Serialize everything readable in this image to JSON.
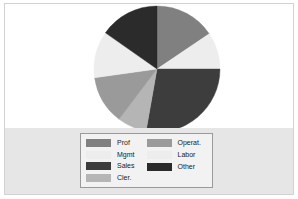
{
  "figure": {
    "background_color": "#ffffff",
    "band_color": "#e6e6e6",
    "frame_color": "#d2d2d2"
  },
  "chart_data": {
    "type": "pie",
    "title": "",
    "subtitle": "",
    "xlabel": "",
    "ylabel": "",
    "grid": false,
    "legend_position": "bottom",
    "start_angle_deg": 90,
    "direction": "clockwise",
    "categories": [
      "Prof",
      "Labor",
      "Sales",
      "Cler.",
      "Operat.",
      "Mgmt",
      "Other"
    ],
    "values": [
      15.5,
      9.5,
      27.8,
      7.5,
      12.5,
      12.0,
      15.2
    ],
    "angles_deg": [
      56,
      34,
      100,
      27,
      45,
      43,
      55
    ],
    "colors": [
      "#808080",
      "#ededed",
      "#3d3d3d",
      "#b5b5b5",
      "#9a9a9a",
      "#ededed",
      "#2b2b2b"
    ],
    "slices": [
      {
        "label": "Prof",
        "value": 15.5,
        "angle_deg": 56,
        "color": "#808080"
      },
      {
        "label": "Labor",
        "value": 9.5,
        "angle_deg": 34,
        "color": "#ededed"
      },
      {
        "label": "Sales",
        "value": 27.8,
        "angle_deg": 100,
        "color": "#3d3d3d"
      },
      {
        "label": "Cler.",
        "value": 7.5,
        "angle_deg": 27,
        "color": "#b5b5b5"
      },
      {
        "label": "Operat.",
        "value": 12.5,
        "angle_deg": 45,
        "color": "#9a9a9a"
      },
      {
        "label": "Mgmt",
        "value": 12.0,
        "angle_deg": 43,
        "color": "#ededed"
      },
      {
        "label": "Other",
        "value": 15.2,
        "angle_deg": 55,
        "color": "#2b2b2b"
      }
    ]
  },
  "legend": {
    "columns": [
      {
        "entries": [
          {
            "label": "Prof",
            "color": "#808080"
          },
          {
            "label": "Mgmt",
            "color": "#ededed"
          },
          {
            "label": "Sales",
            "color": "#3d3d3d"
          },
          {
            "label": "Cler.",
            "color": "#b5b5b5"
          }
        ]
      },
      {
        "entries": [
          {
            "label": "Operat.",
            "color": "#9a9a9a"
          },
          {
            "label": "Labor",
            "color": "#ededed"
          },
          {
            "label": "Other",
            "color": "#2b2b2b"
          }
        ]
      }
    ]
  }
}
